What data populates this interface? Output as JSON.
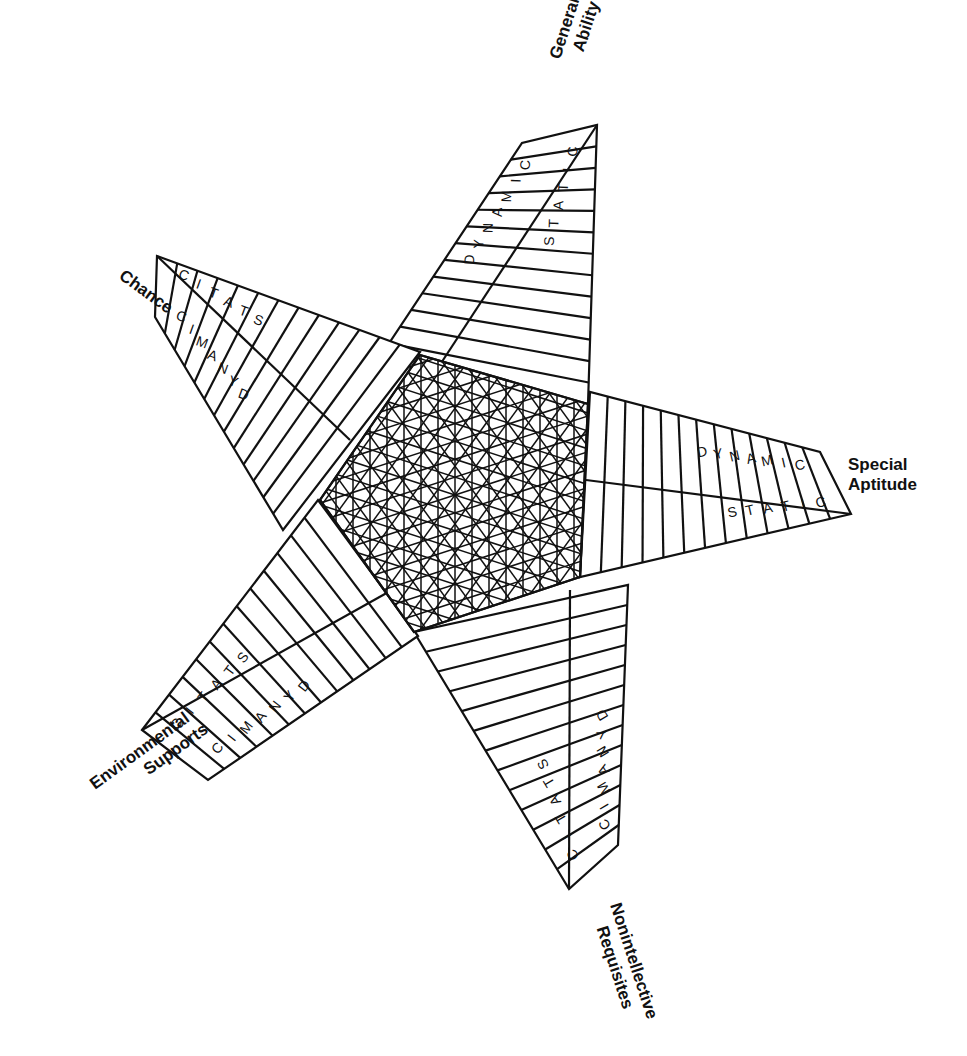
{
  "diagram": {
    "type": "five-pointed star model",
    "center_pattern": "crosshatched pentagon",
    "colors": {
      "ink": "#111111",
      "background": "#ffffff"
    },
    "points": [
      {
        "id": "general-ability",
        "label_lines": [
          "General",
          "Ability"
        ],
        "tip": [
          597,
          125
        ],
        "inner_band": {
          "word": "STATIC",
          "letters": [
            "S",
            "T",
            "A",
            "T",
            "I",
            "C"
          ]
        },
        "outer_band": {
          "word": "DYNAMIC",
          "letters": [
            "D",
            "Y",
            "N",
            "A",
            "M",
            "I",
            "C"
          ]
        },
        "label_pos": [
          560,
          60
        ],
        "label_rotate": -72
      },
      {
        "id": "special-aptitude",
        "label_lines": [
          "Special",
          "Aptitude"
        ],
        "tip": [
          851,
          514
        ],
        "inner_band": {
          "word": "STATIC",
          "letters": [
            "S",
            "T",
            "A",
            "T",
            "I",
            "C"
          ]
        },
        "outer_band": {
          "word": "DYNAMIC",
          "letters": [
            "D",
            "Y",
            "N",
            "A",
            "M",
            "I",
            "C"
          ]
        },
        "label_pos": [
          848,
          470
        ],
        "label_rotate": 0
      },
      {
        "id": "nonintellective-requisites",
        "label_lines": [
          "Nonintellective",
          "Requisites"
        ],
        "tip": [
          569,
          889
        ],
        "inner_band": {
          "word": "STATIC",
          "letters": [
            "S",
            "T",
            "A",
            "T",
            "I",
            "C"
          ]
        },
        "outer_band": {
          "word": "DYNAMIC",
          "letters": [
            "D",
            "Y",
            "N",
            "A",
            "M",
            "I",
            "C"
          ]
        },
        "label_pos": [
          610,
          905
        ],
        "label_rotate": 72
      },
      {
        "id": "environmental-supports",
        "label_lines": [
          "Environmental",
          "Supports"
        ],
        "tip": [
          142,
          730
        ],
        "inner_band": {
          "word": "STATIC",
          "letters": [
            "S",
            "T",
            "A",
            "T",
            "I",
            "C"
          ]
        },
        "outer_band": {
          "word": "DYNAMIC",
          "letters": [
            "D",
            "Y",
            "N",
            "A",
            "M",
            "I",
            "C"
          ]
        },
        "label_pos": [
          95,
          790
        ],
        "label_rotate": -36
      },
      {
        "id": "chance",
        "label_lines": [
          "Chance"
        ],
        "tip": [
          157,
          256
        ],
        "inner_band": {
          "word": "STATIC",
          "letters": [
            "S",
            "T",
            "A",
            "T",
            "I",
            "C"
          ]
        },
        "outer_band": {
          "word": "DYNAMIC",
          "letters": [
            "D",
            "Y",
            "N",
            "A",
            "M",
            "I",
            "C"
          ]
        },
        "label_pos": [
          118,
          278
        ],
        "label_rotate": 36
      }
    ]
  }
}
